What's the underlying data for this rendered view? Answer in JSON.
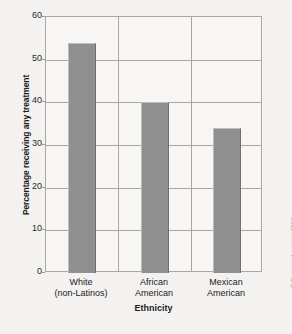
{
  "chart_data": {
    "type": "bar",
    "title": "",
    "xlabel": "Ethnicity",
    "ylabel": "Percentage receiving any treatment",
    "categories": [
      "White\n(non-Latinos)",
      "African\nAmerican",
      "Mexican\nAmerican"
    ],
    "category_lines": [
      [
        "White",
        "(non-Latinos)"
      ],
      [
        "African",
        "American"
      ],
      [
        "Mexican",
        "American"
      ]
    ],
    "values": [
      54,
      40,
      34
    ],
    "ylim": [
      0,
      60
    ],
    "yticks": [
      0,
      10,
      20,
      30,
      40,
      50,
      60
    ],
    "ytick_labels": [
      "0",
      "10",
      "20",
      "30",
      "40",
      "50",
      "60"
    ],
    "grid": "horizontal",
    "legend": "none",
    "bar_color": "#8f8f8f",
    "plot_background": "#f7f6f4",
    "grid_color": "#a6a6a4",
    "axis_color": "#a8a8a6",
    "figure_background": "#f3f2f0"
  },
  "credit": {
    "text": "© Cengage Learning 2013"
  }
}
